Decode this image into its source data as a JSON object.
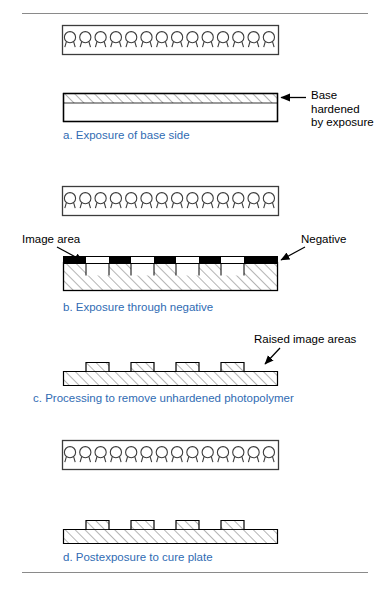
{
  "figure": {
    "accent_color": "#2f6bb3",
    "line_color": "#000000",
    "rule_color": "#8a8a8a",
    "hatch_color": "#5a5a5a",
    "opaque_color": "#000000"
  },
  "steps": [
    {
      "id": "a",
      "caption": "a. Exposure of base side",
      "lamp_count": 14,
      "has_lamp_bank": true,
      "plate": "uniform slab with hardened band at top"
    },
    {
      "id": "b",
      "caption": "b. Exposure through negative",
      "lamp_count": 14,
      "has_lamp_bank": true,
      "plate": "slab with negative strip of opaque and clear segments"
    },
    {
      "id": "c",
      "caption": "c. Processing to remove unhardened photopolymer",
      "lamp_count": 0,
      "has_lamp_bank": false,
      "plate": "relief profile with raised image areas and notches"
    },
    {
      "id": "d",
      "caption": "d. Postexposure to cure plate",
      "lamp_count": 14,
      "has_lamp_bank": true,
      "plate": "relief profile with raised image areas and notches"
    }
  ],
  "annotations": [
    {
      "id": "base-hardened",
      "text": "Base\nhardened\nby exposure",
      "step": "a"
    },
    {
      "id": "image-area",
      "text": "Image area",
      "step": "b"
    },
    {
      "id": "negative",
      "text": "Negative",
      "step": "b"
    },
    {
      "id": "raised-image-areas",
      "text": "Raised image areas",
      "step": "c"
    }
  ]
}
